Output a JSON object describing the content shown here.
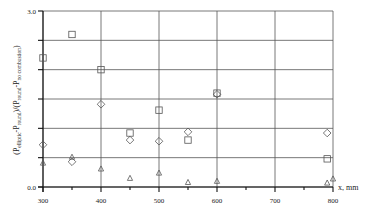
{
  "chart_data": {
    "type": "scatter",
    "title": "",
    "xlabel": "x, mm",
    "ylabel": "(P_elliptic - P_round)/(P_round - P_no combustion)",
    "ylabel_parts": {
      "open": "(P",
      "sub1": "elliptic",
      "mid1": "-P",
      "sub2": "round",
      "mid2": ")/(P",
      "sub3": "round",
      "mid3": "-P",
      "sub4": "no combustion",
      "close": ")"
    },
    "xlim": [
      300,
      800
    ],
    "ylim": [
      0.0,
      3.0
    ],
    "x_ticks": [
      300,
      400,
      500,
      600,
      700,
      800
    ],
    "x_tick_labels": [
      "300",
      "400",
      "500",
      "600",
      "700",
      "800"
    ],
    "x_minor_ticks": [
      350,
      450,
      550,
      650,
      750
    ],
    "y_ticks": [
      0.0,
      0.5,
      1.0,
      1.5,
      2.0,
      2.5,
      3.0
    ],
    "y_tick_labels": [
      "0.0",
      "3.0"
    ],
    "y_labeled_ticks": [
      0.0,
      3.0
    ],
    "grid": true,
    "legend": null,
    "series": [
      {
        "name": "square",
        "marker": "square",
        "points": [
          {
            "x": 300,
            "y": 2.2
          },
          {
            "x": 350,
            "y": 2.6
          },
          {
            "x": 400,
            "y": 2.0
          },
          {
            "x": 450,
            "y": 0.92
          },
          {
            "x": 500,
            "y": 1.31
          },
          {
            "x": 550,
            "y": 0.8
          },
          {
            "x": 600,
            "y": 1.6
          },
          {
            "x": 790,
            "y": 0.48
          }
        ]
      },
      {
        "name": "diamond",
        "marker": "diamond",
        "points": [
          {
            "x": 300,
            "y": 0.72
          },
          {
            "x": 350,
            "y": 0.43
          },
          {
            "x": 400,
            "y": 1.41
          },
          {
            "x": 450,
            "y": 0.8
          },
          {
            "x": 500,
            "y": 0.78
          },
          {
            "x": 550,
            "y": 0.94
          },
          {
            "x": 600,
            "y": 1.58
          },
          {
            "x": 790,
            "y": 0.92
          }
        ]
      },
      {
        "name": "triangle",
        "marker": "triangle",
        "points": [
          {
            "x": 300,
            "y": 0.41
          },
          {
            "x": 350,
            "y": 0.51
          },
          {
            "x": 400,
            "y": 0.31
          },
          {
            "x": 450,
            "y": 0.15
          },
          {
            "x": 500,
            "y": 0.24
          },
          {
            "x": 550,
            "y": 0.08
          },
          {
            "x": 600,
            "y": 0.1
          },
          {
            "x": 790,
            "y": 0.07
          },
          {
            "x": 800,
            "y": 0.14
          }
        ]
      }
    ]
  },
  "colors": {
    "axis": "#111111",
    "grid": "#555555",
    "marker": "#555555",
    "text": "#222222",
    "background": "#ffffff"
  }
}
